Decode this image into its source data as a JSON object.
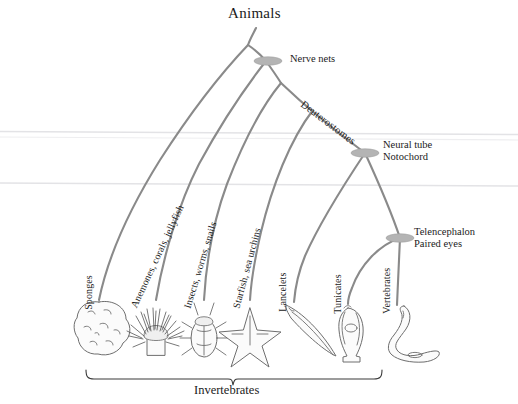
{
  "figure": {
    "type": "phylogenetic-tree",
    "root_label": "Animals",
    "group_bracket_label": "Invertebrates"
  },
  "node_labels": {
    "nerve_nets": "Nerve nets",
    "deuterostomes": "Deuterostomes",
    "neural_tube": "Neural tube",
    "notochord": "Notochord",
    "telencephalon": "Telencephalon",
    "paired_eyes": "Paired eyes"
  },
  "taxa": [
    {
      "id": "sponges",
      "label": "Sponges",
      "organism": "sponge"
    },
    {
      "id": "cnidarians",
      "label": "Anemones, corals, jellyfish",
      "organism": "sea-anemone"
    },
    {
      "id": "protostomes",
      "label": "Insects, worms, snails",
      "organism": "beetle"
    },
    {
      "id": "echinoderms",
      "label": "Starfish, sea urchins",
      "organism": "starfish"
    },
    {
      "id": "lancelets",
      "label": "Lancelets",
      "organism": "lancelet"
    },
    {
      "id": "tunicates",
      "label": "Tunicates",
      "organism": "tunicate"
    },
    {
      "id": "vertebrates",
      "label": "Vertebrates",
      "organism": "fish"
    }
  ],
  "colors": {
    "branch": "#8a8a8a",
    "node": "#b4b4b4",
    "text": "#1b1b1b",
    "background": "#ffffff",
    "rule": "#e3e3e6"
  }
}
